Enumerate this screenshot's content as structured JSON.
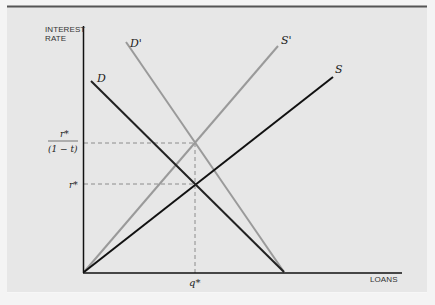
{
  "figure": {
    "y_axis_label_line1": "INTEREST",
    "y_axis_label_line2": "RATE",
    "x_axis_label": "LOANS",
    "curves": {
      "D": "D",
      "D_prime": "D'",
      "S": "S",
      "S_prime": "S'"
    },
    "y_ticks": {
      "upper_numerator": "r*",
      "upper_denominator": "(1 − t)",
      "lower": "r*"
    },
    "x_ticks": {
      "q": "q*"
    }
  }
}
